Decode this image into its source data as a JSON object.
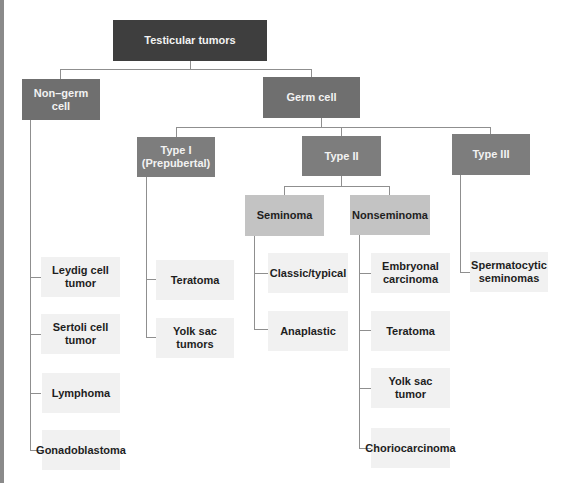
{
  "diagram": {
    "type": "tree",
    "root": "Testicular tumors",
    "non_germ_cell": {
      "label": "Non–germ cell",
      "children": [
        "Leydig cell tumor",
        "Sertoli cell tumor",
        "Lymphoma",
        "Gonadoblastoma"
      ]
    },
    "germ_cell": {
      "label": "Germ cell",
      "type1": {
        "label_line1": "Type I",
        "label_line2": "(Prepubertal)",
        "children": [
          "Teratoma",
          "Yolk sac tumors"
        ]
      },
      "type2": {
        "label": "Type II",
        "seminoma": {
          "label": "Seminoma",
          "children": [
            "Classic/typical",
            "Anaplastic"
          ]
        },
        "nonseminoma": {
          "label": "Nonseminoma",
          "children": [
            {
              "line1": "Embryonal",
              "line2": "carcinoma"
            },
            "Teratoma",
            "Yolk sac tumor",
            "Choriocarcinoma"
          ]
        }
      },
      "type3": {
        "label": "Type III",
        "children": [
          {
            "line1": "Spermatocytic",
            "line2": "seminomas"
          }
        ]
      }
    }
  },
  "colors": {
    "root": "#3e3e3e",
    "level1": "#6f6f6f",
    "level2": "#7d7d7d",
    "level3": "#c3c3c3",
    "leaf": "#f1f1f1",
    "connector": "#8f8f8f"
  }
}
